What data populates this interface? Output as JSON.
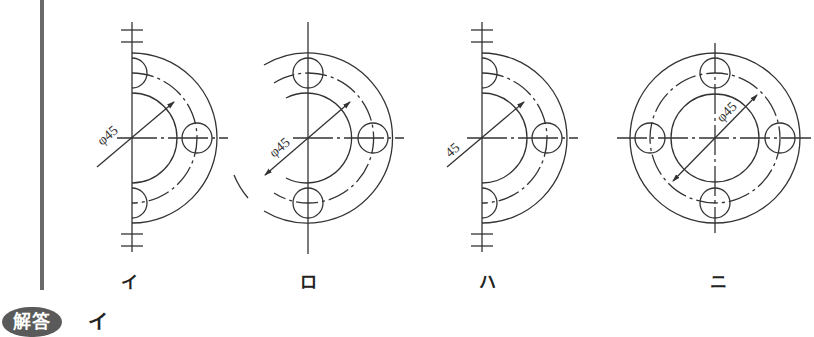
{
  "figures": [
    {
      "id": "i",
      "label": "イ",
      "dimension_text": "φ45",
      "type": "half-view-with-symmetry-marks",
      "center": [
        132,
        138
      ]
    },
    {
      "id": "ro",
      "label": "ロ",
      "dimension_text": "φ45",
      "type": "partial-view-extended-arcs",
      "center": [
        308,
        138
      ]
    },
    {
      "id": "ha",
      "label": "ハ",
      "dimension_text": "45",
      "type": "half-view-with-symmetry-marks",
      "center": [
        482,
        138
      ]
    },
    {
      "id": "ni",
      "label": "ニ",
      "dimension_text": "φ45",
      "type": "full-view",
      "center": [
        715,
        138
      ]
    }
  ],
  "geometry": {
    "outer_radius": 85,
    "pcd_radius": 65,
    "inner_radius": 45,
    "hole_radius": 15
  },
  "answer": {
    "badge_label": "解答",
    "value": "イ"
  },
  "colors": {
    "line": "#333333",
    "bar": "#6a6a6a",
    "badge": "#5a5a5a"
  }
}
